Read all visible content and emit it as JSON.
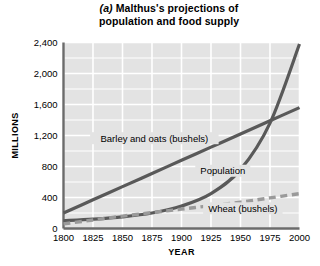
{
  "figure": {
    "marker": "(a)",
    "title_line_1": "Malthus's projections of",
    "title_line_2": "population and food supply"
  },
  "chart_data": {
    "type": "line",
    "xlabel": "YEAR",
    "ylabel": "MILLIONS",
    "xlim": [
      1800,
      2000
    ],
    "ylim": [
      0,
      2400
    ],
    "xticks": [
      1800,
      1825,
      1850,
      1875,
      1900,
      1925,
      1950,
      1975,
      2000
    ],
    "xtick_labels": [
      "1800",
      "1825",
      "1850",
      "1875",
      "1900",
      "1925",
      "1950",
      "1975",
      "2000"
    ],
    "yticks": [
      0,
      400,
      800,
      1200,
      1600,
      2000,
      2400
    ],
    "ytick_labels": [
      "0",
      "400",
      "800",
      "1,200",
      "1,600",
      "2,000",
      "2,400"
    ],
    "grid": true,
    "grid_color": "#ffffff",
    "plot_background": "#e3e3e3",
    "legend": "inline-labels",
    "x": [
      1800,
      1825,
      1850,
      1875,
      1900,
      1925,
      1950,
      1975,
      2000
    ],
    "series": [
      {
        "name": "Barley and oats (bushels)",
        "style": "solid",
        "color": "#595959",
        "label_x": 1877,
        "label_y": 1120,
        "values": [
          200,
          370,
          540,
          710,
          880,
          1050,
          1220,
          1390,
          1560
        ]
      },
      {
        "name": "Population",
        "style": "solid",
        "color": "#595959",
        "label_x": 1935,
        "label_y": 700,
        "values": [
          100,
          120,
          150,
          200,
          290,
          450,
          760,
          1360,
          2380
        ]
      },
      {
        "name": "Wheat (bushels)",
        "style": "dashed",
        "color": "#9a9a9a",
        "label_x": 1952,
        "label_y": 215,
        "values": [
          60,
          110,
          160,
          205,
          250,
          295,
          340,
          395,
          450
        ]
      }
    ]
  }
}
